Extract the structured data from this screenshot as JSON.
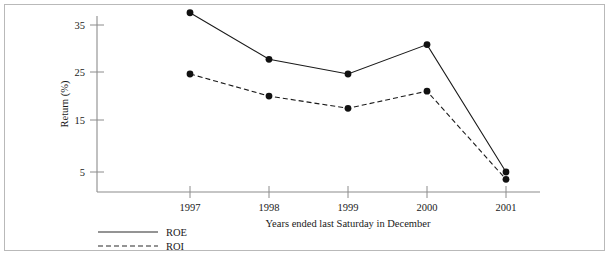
{
  "chart_data": {
    "type": "line",
    "title": "",
    "xlabel": "Years ended last Saturday in December",
    "ylabel": "Return (%)",
    "categories": [
      "1997",
      "1998",
      "1999",
      "2000",
      "2001"
    ],
    "x_tick_labels": [
      "1997",
      "1998",
      "1999",
      "2000",
      "2001"
    ],
    "y_tick_labels": [
      "35",
      "25",
      "15",
      "5"
    ],
    "y_ticks": [
      35,
      25,
      15,
      5
    ],
    "ylim": [
      0,
      40
    ],
    "grid": false,
    "legend_position": "below-left",
    "series": [
      {
        "name": "ROE",
        "style": "solid",
        "color": "#1a1a1a",
        "marker": "filled-circle",
        "values": [
          37.5,
          28.0,
          25.0,
          31.0,
          5.0
        ]
      },
      {
        "name": "ROI",
        "style": "dashed",
        "color": "#1a1a1a",
        "marker": "filled-circle",
        "values": [
          25.0,
          20.5,
          18.0,
          21.5,
          3.5
        ]
      }
    ]
  },
  "legend": {
    "entries": [
      {
        "label": "ROE",
        "style": "solid"
      },
      {
        "label": "ROI",
        "style": "dashed"
      }
    ]
  },
  "axes": {
    "y_label": "Return (%)",
    "x_label": "Years ended last Saturday in December"
  },
  "colors": {
    "axis": "#8c8c8c",
    "line": "#2a2a2a",
    "marker": "#111111",
    "border": "#b9b9b9",
    "text": "#1a1a1a"
  }
}
